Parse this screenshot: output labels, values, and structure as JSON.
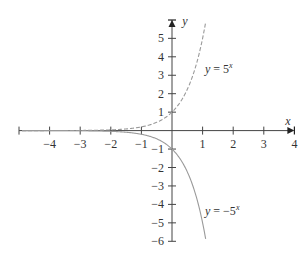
{
  "chart_data": {
    "type": "line",
    "title": "",
    "xlabel": "x",
    "ylabel": "y",
    "xlim": [
      -5,
      4
    ],
    "ylim": [
      -6,
      6
    ],
    "x_ticks": [
      -4,
      -3,
      -2,
      -1,
      1,
      2,
      3,
      4
    ],
    "x_tick_labels": [
      "−4",
      "−3",
      "−2",
      "−1",
      "1",
      "2",
      "3",
      "4"
    ],
    "y_ticks": [
      5,
      4,
      3,
      2,
      1,
      -1,
      -2,
      -3,
      -4,
      -5,
      -6
    ],
    "y_tick_labels": [
      "5",
      "4",
      "3",
      "2",
      "1",
      "−1",
      "−2",
      "−3",
      "−4",
      "−5",
      "−6"
    ],
    "grid": false,
    "legend": "none (curves labeled inline)",
    "series": [
      {
        "name": "y = 5^x",
        "label_text": "y = 5",
        "label_exp": "x",
        "style": "dashed",
        "color": "#9a9a9a",
        "x": [
          -5,
          -4,
          -3,
          -2,
          -1,
          0,
          0.5,
          1,
          1.1
        ],
        "values": [
          0.00032,
          0.0016,
          0.008,
          0.04,
          0.2,
          1,
          2.24,
          5,
          5.87
        ]
      },
      {
        "name": "y = -5^x",
        "label_text": "y = −5",
        "label_exp": "x",
        "style": "solid",
        "color": "#9a9a9a",
        "x": [
          -5,
          -4,
          -3,
          -2,
          -1,
          0,
          0.5,
          1,
          1.1
        ],
        "values": [
          -0.00032,
          -0.0016,
          -0.008,
          -0.04,
          -0.2,
          -1,
          -2.24,
          -5,
          -5.87
        ]
      }
    ]
  }
}
